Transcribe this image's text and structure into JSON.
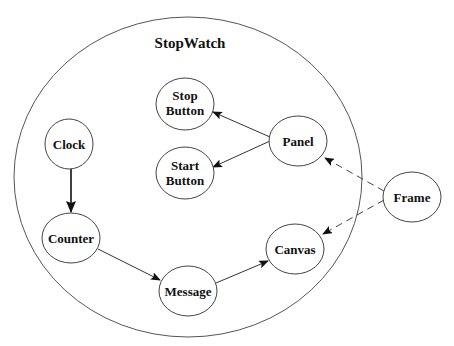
{
  "diagram": {
    "container": {
      "label": "StopWatch"
    },
    "nodes": {
      "stop_button": {
        "line1": "Stop",
        "line2": "Button"
      },
      "start_button": {
        "line1": "Start",
        "line2": "Button"
      },
      "panel": {
        "label": "Panel"
      },
      "clock": {
        "label": "Clock"
      },
      "counter": {
        "label": "Counter"
      },
      "message": {
        "label": "Message"
      },
      "canvas": {
        "label": "Canvas"
      },
      "frame": {
        "label": "Frame"
      }
    },
    "edges": [
      {
        "from": "Panel",
        "to": "Stop Button",
        "style": "solid"
      },
      {
        "from": "Panel",
        "to": "Start Button",
        "style": "solid"
      },
      {
        "from": "Clock",
        "to": "Counter",
        "style": "solid-bold"
      },
      {
        "from": "Counter",
        "to": "Message",
        "style": "solid"
      },
      {
        "from": "Message",
        "to": "Canvas",
        "style": "solid"
      },
      {
        "from": "Frame",
        "to": "Panel",
        "style": "dashed"
      },
      {
        "from": "Frame",
        "to": "Canvas",
        "style": "dashed"
      }
    ]
  }
}
